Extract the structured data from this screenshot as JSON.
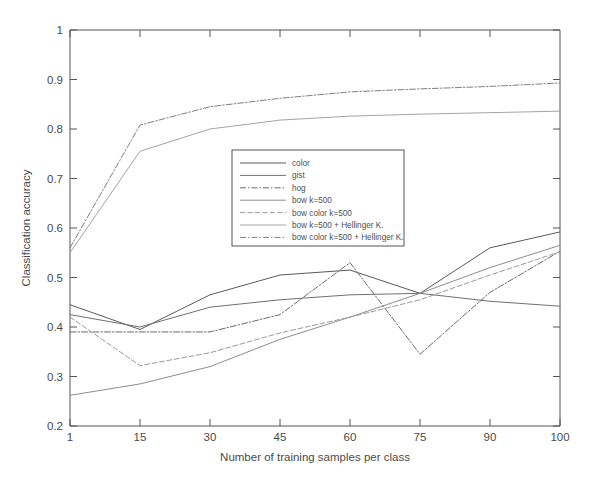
{
  "chart_data": {
    "type": "line",
    "title": "",
    "xlabel": "Number of training samples per class",
    "ylabel": "Classification accuracy",
    "x": [
      1,
      15,
      30,
      45,
      60,
      75,
      90,
      100
    ],
    "xticklabels": [
      "1",
      "15",
      "30",
      "45",
      "60",
      "75",
      "90",
      "100"
    ],
    "yticklabels": [
      "0.2",
      "0.3",
      "0.4",
      "0.5",
      "0.6",
      "0.7",
      "0.8",
      "0.9",
      "1"
    ],
    "ylim": [
      0.2,
      1.0
    ],
    "ytick_step": 0.1,
    "xaxis_spacing": "categorical",
    "grid": false,
    "legend_position": "center",
    "series": [
      {
        "name": "color",
        "style": "solid",
        "color": "#5a5a5a",
        "values": [
          0.445,
          0.395,
          0.465,
          0.505,
          0.515,
          0.468,
          0.56,
          0.592
        ]
      },
      {
        "name": "gist",
        "style": "solid",
        "color": "#707070",
        "values": [
          0.425,
          0.4,
          0.44,
          0.455,
          0.465,
          0.468,
          0.452,
          0.442
        ]
      },
      {
        "name": "hog",
        "style": "dash-dot",
        "color": "#6a6a6a",
        "values": [
          0.39,
          0.39,
          0.39,
          0.425,
          0.53,
          0.345,
          0.47,
          0.553
        ]
      },
      {
        "name": "bow k=500",
        "style": "solid-light",
        "color": "#8e8e8e",
        "values": [
          0.262,
          0.285,
          0.32,
          0.375,
          0.42,
          0.468,
          0.52,
          0.565
        ]
      },
      {
        "name": "bow color k=500",
        "style": "dashed",
        "color": "#9a9a9a",
        "values": [
          0.42,
          0.322,
          0.348,
          0.388,
          0.42,
          0.455,
          0.505,
          0.552
        ]
      },
      {
        "name": "bow k=500 + Hellinger K.",
        "style": "solid-thin",
        "color": "#a4a4a4",
        "values": [
          0.55,
          0.755,
          0.8,
          0.818,
          0.826,
          0.83,
          0.833,
          0.836
        ]
      },
      {
        "name": "bow color k=500 + Hellinger K.",
        "style": "dash-dot-light",
        "color": "#808080",
        "values": [
          0.56,
          0.808,
          0.845,
          0.862,
          0.875,
          0.881,
          0.886,
          0.893
        ]
      }
    ]
  },
  "legend": {
    "entries": [
      "color",
      "gist",
      "hog",
      "bow k=500",
      "bow color k=500",
      "bow k=500 + Hellinger K.",
      "bow color k=500 + Hellinger K."
    ]
  },
  "axes": {
    "x_title": "Number of training samples per class",
    "y_title": "Classification accuracy",
    "x_ticks": [
      "1",
      "15",
      "30",
      "45",
      "60",
      "75",
      "90",
      "100"
    ],
    "y_ticks": [
      "1",
      "0.9",
      "0.8",
      "0.7",
      "0.6",
      "0.5",
      "0.4",
      "0.3",
      "0.2"
    ]
  }
}
